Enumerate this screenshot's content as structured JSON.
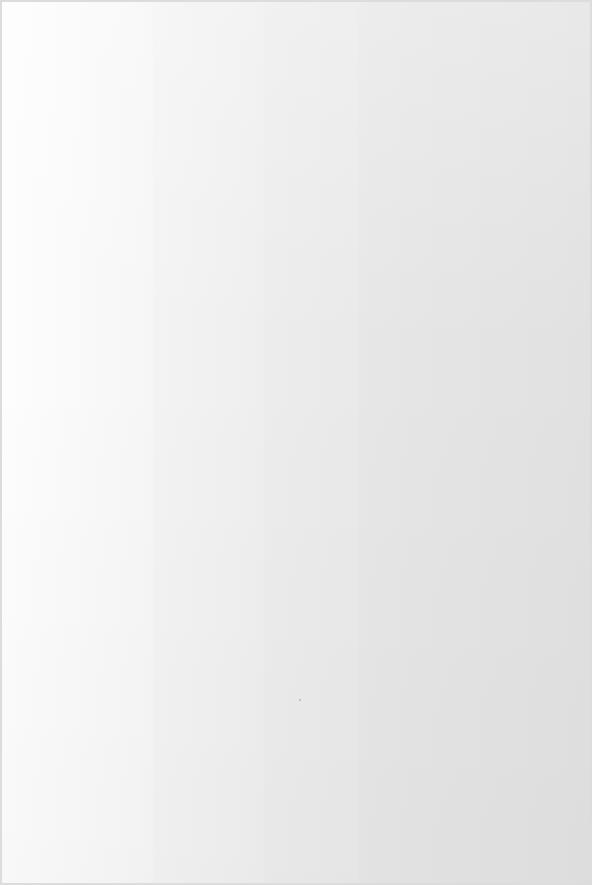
{
  "document": {
    "description": "Blank scanned paper sheet",
    "content_text": "",
    "colors": {
      "paper_light": "#fdfdfd",
      "paper_mid": "#f1f1f1",
      "paper_dark": "#e8e8e8",
      "border": "#dcdcdc",
      "speck": "#b5b5b5"
    }
  }
}
